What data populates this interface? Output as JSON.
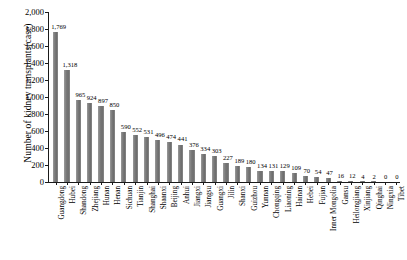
{
  "chart_data": {
    "type": "bar",
    "title": "",
    "xlabel": "",
    "ylabel": "Number of kidney transplants(case)",
    "ylim": [
      0,
      2000
    ],
    "ytick_labels": [
      "2,000",
      "1,800",
      "1,600",
      "1,400",
      "1,200",
      "1,000",
      "800",
      "600",
      "400",
      "200",
      "0"
    ],
    "ytick_values": [
      2000,
      1800,
      1600,
      1400,
      1200,
      1000,
      800,
      600,
      400,
      200,
      0
    ],
    "grid": false,
    "legend": null,
    "bar_color": "#7a7a7a",
    "axis_color": "#1a1a1a",
    "categories": [
      "Guangdong",
      "Hubei",
      "Shandong",
      "Zhejiang",
      "Hunan",
      "Henan",
      "Sichuan",
      "Tianjin",
      "Shanghai",
      "Shaanxi",
      "Beijing",
      "Anhui",
      "Jiangxi",
      "Jiangsu",
      "Guangxi",
      "Jilin",
      "Shanxi",
      "Guizhou",
      "Yunnan",
      "Chongqing",
      "Liaoning",
      "Hainan",
      "Hebei",
      "Fujian",
      "Inner Mongolia",
      "Gansu",
      "Heilongjiang",
      "Xinjiang",
      "Qinghai",
      "Ningxia",
      "Tibet"
    ],
    "values": [
      1769,
      1318,
      965,
      924,
      897,
      850,
      590,
      552,
      531,
      496,
      474,
      441,
      376,
      334,
      303,
      227,
      189,
      180,
      134,
      131,
      129,
      109,
      70,
      54,
      47,
      16,
      12,
      4,
      2,
      0,
      0
    ],
    "value_labels": [
      "1,769",
      "1,318",
      "965",
      "924",
      "897",
      "850",
      "590",
      "552",
      "531",
      "496",
      "474",
      "441",
      "376",
      "334",
      "303",
      "227",
      "189",
      "180",
      "134",
      "131",
      "129",
      "109",
      "70",
      "54",
      "47",
      "16",
      "12",
      "4",
      "2",
      "0",
      "0"
    ]
  }
}
